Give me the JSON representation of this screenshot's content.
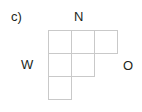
{
  "figure": {
    "label": "c)",
    "background_color": "#ffffff",
    "text_color": "#231f20",
    "grid_line_color": "#c9c9c9",
    "cell_fill_color": "#ffffff"
  },
  "labels": {
    "north": "N",
    "west": "W",
    "other": "O"
  },
  "shape": {
    "name": "staircase-polyomino",
    "rows": 3,
    "columns": 3,
    "cell_size": 23,
    "filled_cells": [
      {
        "row": 0,
        "col": 0
      },
      {
        "row": 0,
        "col": 1
      },
      {
        "row": 0,
        "col": 2
      },
      {
        "row": 1,
        "col": 0
      },
      {
        "row": 1,
        "col": 1
      },
      {
        "row": 2,
        "col": 0
      }
    ],
    "row_counts": [
      3,
      2,
      1
    ],
    "total_cells": 6
  }
}
